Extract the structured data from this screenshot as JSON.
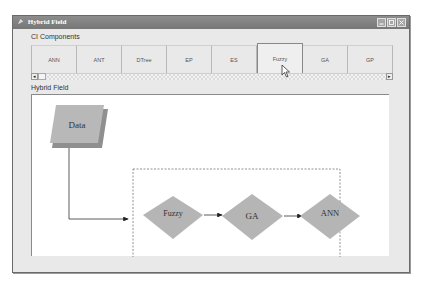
{
  "window": {
    "title": "Hybrid Field",
    "controls": [
      "minimize-icon",
      "maximize-icon",
      "close-icon"
    ]
  },
  "ci_components": {
    "label": "CI Components",
    "tabs": [
      {
        "label": "ANN",
        "selected": false
      },
      {
        "label": "ANT",
        "selected": false
      },
      {
        "label": "DTree",
        "selected": false
      },
      {
        "label": "EP",
        "selected": false
      },
      {
        "label": "ES",
        "selected": false
      },
      {
        "label": "Fuzzy",
        "selected": true
      },
      {
        "label": "GA",
        "selected": false
      },
      {
        "label": "GP",
        "selected": false
      }
    ],
    "scroll_left": "◂",
    "scroll_right": "▸"
  },
  "hybrid_field": {
    "label": "Hybrid Field",
    "data_node": "Data",
    "pipeline": [
      "Fuzzy",
      "GA",
      "ANN"
    ]
  },
  "colors": {
    "node_fill": "#b5b5b5",
    "node_shadow": "#8f8f8f",
    "titlebar": "#808080"
  }
}
